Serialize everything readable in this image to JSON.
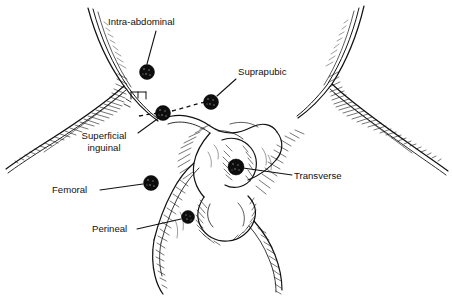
{
  "figure": {
    "background_color": "#ffffff",
    "ink_color": "#111111",
    "marker_color": "#0d0d0d",
    "width": 452,
    "height": 307
  },
  "labels": [
    {
      "id": "intra-abdominal",
      "text": "Intra-abdominal",
      "lines": [
        "Intra-abdominal"
      ],
      "text_x": 108,
      "text_y": 25,
      "anchor": "start",
      "leader": {
        "x1": 156,
        "y1": 31,
        "x2": 147,
        "y2": 64
      },
      "marker": {
        "cx": 147,
        "cy": 72,
        "r": 7.5
      }
    },
    {
      "id": "suprapubic",
      "text": "Suprapubic",
      "lines": [
        "Suprapubic"
      ],
      "text_x": 238,
      "text_y": 75,
      "anchor": "start",
      "leader": {
        "x1": 236,
        "y1": 79,
        "x2": 217,
        "y2": 96
      },
      "marker": {
        "cx": 211,
        "cy": 102,
        "r": 7.5
      }
    },
    {
      "id": "superficial-inguinal",
      "text": "Superficial inguinal",
      "lines": [
        "Superficial",
        "inguinal"
      ],
      "text_x": 104,
      "text_y": 139,
      "anchor": "middle",
      "leader": {
        "x1": 138,
        "y1": 133,
        "x2": 160,
        "y2": 117
      },
      "marker": {
        "cx": 163,
        "cy": 113,
        "r": 7.5
      }
    },
    {
      "id": "femoral",
      "text": "Femoral",
      "lines": [
        "Femoral"
      ],
      "text_x": 52,
      "text_y": 193,
      "anchor": "start",
      "leader": {
        "x1": 100,
        "y1": 190,
        "x2": 143,
        "y2": 184
      },
      "marker": {
        "cx": 151,
        "cy": 183,
        "r": 7.5
      }
    },
    {
      "id": "perineal",
      "text": "Perineal",
      "lines": [
        "Perineal"
      ],
      "text_x": 92,
      "text_y": 232,
      "anchor": "start",
      "leader": {
        "x1": 137,
        "y1": 229,
        "x2": 181,
        "y2": 219
      },
      "marker": {
        "cx": 188,
        "cy": 217,
        "r": 6.5
      }
    },
    {
      "id": "transverse",
      "text": "Transverse",
      "lines": [
        "Transverse"
      ],
      "text_x": 294,
      "text_y": 179,
      "anchor": "start",
      "leader": {
        "x1": 292,
        "y1": 175,
        "x2": 243,
        "y2": 168
      },
      "marker": {
        "cx": 236,
        "cy": 167,
        "r": 8.0
      }
    }
  ],
  "annotations": {
    "dashed_inguinal_canal": "dashed line tracing the inguinal canal between markers",
    "bracket": "small bracket hatch mark at inguinal ring"
  }
}
